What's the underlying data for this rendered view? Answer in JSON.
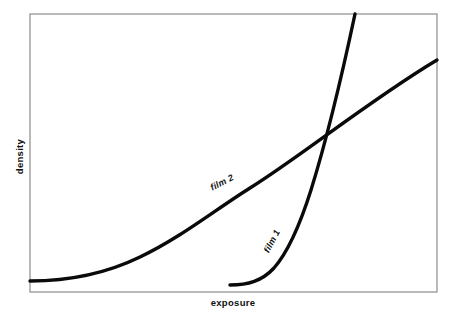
{
  "figure": {
    "type": "characteristic-curve-diagram",
    "background_color": "#ffffff",
    "frame_color": "#8c8c8c",
    "curve_color": "#0a0a0a"
  },
  "axes": {
    "x_label": "exposure",
    "y_label": "density",
    "x_ticks": [],
    "y_ticks": [],
    "grid": false,
    "frame": {
      "left": 30,
      "top": 14,
      "right": 437,
      "bottom": 292
    }
  },
  "curves": [
    {
      "name": "film 2",
      "label": "film 2",
      "label_rotation_deg": -27,
      "description": "low-contrast film: long shallow toe rising gradually then a near-straight shoulderless slope to the top-right frame edge",
      "path": "M 30 281 C 70 281, 105 274, 140 257 C 180 238, 215 210, 250 188 C 300 157, 370 100, 437 60",
      "start_point": [
        30,
        281
      ],
      "end_point": [
        437,
        60
      ]
    },
    {
      "name": "film 1",
      "label": "film 1",
      "label_rotation_deg": -62,
      "description": "high-contrast film: short toe starting far right along the baseline then a very steep near-vertical rise exiting the top of the frame",
      "path": "M 230 285 C 248 285, 262 281, 274 268 C 288 252, 299 228, 311 190 C 325 145, 341 80, 355 14",
      "start_point": [
        230,
        285
      ],
      "end_point": [
        355,
        14
      ]
    }
  ],
  "annotations": {
    "intersection_point": [
      321,
      142
    ],
    "intersection_described": true
  },
  "chart_data": {
    "type": "line",
    "title": "",
    "xlabel": "exposure",
    "ylabel": "density",
    "grid": false,
    "legend": "inline-curve-labels",
    "xlim": [
      0,
      1
    ],
    "ylim": [
      0,
      1
    ],
    "series": [
      {
        "name": "film 2",
        "x": [
          0.0,
          0.1,
          0.2,
          0.3,
          0.4,
          0.5,
          0.6,
          0.7,
          0.8,
          0.9,
          1.0
        ],
        "y": [
          0.04,
          0.05,
          0.08,
          0.13,
          0.2,
          0.28,
          0.38,
          0.49,
          0.6,
          0.72,
          0.83
        ]
      },
      {
        "name": "film 1",
        "x": [
          0.49,
          0.53,
          0.58,
          0.63,
          0.68,
          0.73,
          0.78,
          0.8
        ],
        "y": [
          0.03,
          0.05,
          0.12,
          0.25,
          0.42,
          0.62,
          0.85,
          1.0
        ]
      }
    ]
  }
}
